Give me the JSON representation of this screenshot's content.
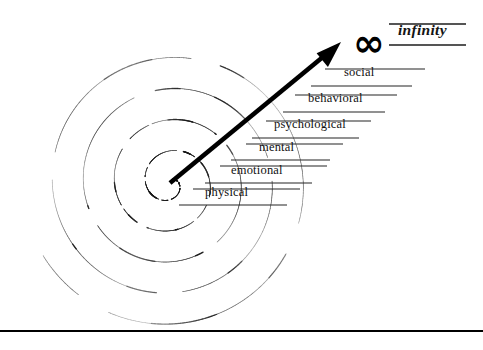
{
  "diagram": {
    "background_color": "#ffffff",
    "ink_color": "#111111",
    "canvas": {
      "width": 483,
      "height": 350
    }
  },
  "spiral": {
    "name": "dotted-spiral",
    "style": "dotted",
    "center": {
      "x": 170,
      "y": 183
    },
    "turns": 4.6,
    "stroke_color": "#1a1a1a"
  },
  "arrow": {
    "name": "growth-arrow",
    "from": {
      "x": 170,
      "y": 183
    },
    "to": {
      "x": 341,
      "y": 42
    },
    "color": "#000000"
  },
  "tiers": [
    {
      "label": "physical",
      "x": 205,
      "y": 198,
      "line_top_x1": 193,
      "line_top_x2": 300,
      "line_top_y": 189,
      "line_bot_x1": 179,
      "line_bot_x2": 287,
      "line_bot_y": 205
    },
    {
      "label": "emotional",
      "x": 231,
      "y": 176,
      "line_top_x1": 220,
      "line_top_x2": 327,
      "line_top_y": 166,
      "line_bot_x1": 205,
      "line_bot_x2": 312,
      "line_bot_y": 183
    },
    {
      "label": "mental",
      "x": 259,
      "y": 153,
      "line_top_x1": 246,
      "line_top_x2": 343,
      "line_top_y": 144,
      "line_bot_x1": 231,
      "line_bot_x2": 330,
      "line_bot_y": 160
    },
    {
      "label": "psychological",
      "x": 274,
      "y": 130,
      "line_top_x1": 266,
      "line_top_x2": 371,
      "line_top_y": 121,
      "line_bot_x1": 252,
      "line_bot_x2": 359,
      "line_bot_y": 138
    },
    {
      "label": "behavioral",
      "x": 308,
      "y": 104,
      "line_top_x1": 295,
      "line_top_x2": 397,
      "line_top_y": 95,
      "line_bot_x1": 283,
      "line_bot_x2": 385,
      "line_bot_y": 112
    },
    {
      "label": "social",
      "x": 344,
      "y": 78,
      "line_top_x1": 325,
      "line_top_x2": 425,
      "line_top_y": 69,
      "line_bot_x1": 311,
      "line_bot_x2": 412,
      "line_bot_y": 86
    }
  ],
  "infinity": {
    "glyph": "infinity-symbol",
    "symbol": "∞",
    "symbol_x": 353,
    "symbol_y": 24,
    "symbol_size": 38,
    "label": "infinity",
    "label_x": 398,
    "label_y": 36,
    "line_top_x1": 389,
    "line_top_x2": 466,
    "line_top_y": 24,
    "line_bot_x1": 389,
    "line_bot_x2": 466,
    "line_bot_y": 45
  },
  "baseline_rule": {
    "name": "bottom-rule",
    "x1": 0,
    "x2": 483,
    "y": 331,
    "thickness": 2,
    "color": "#000000"
  }
}
